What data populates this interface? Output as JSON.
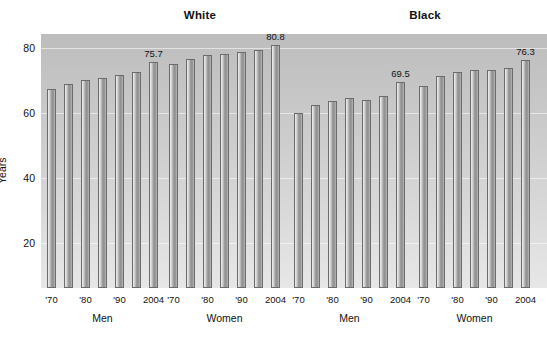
{
  "figure": {
    "clipped_top_text": "",
    "ylabel": "Years",
    "y_ticks": [
      20,
      40,
      60,
      80
    ],
    "group_headers": [
      {
        "label": "White"
      },
      {
        "label": "Black"
      }
    ],
    "sex_labels": [
      "Men",
      "Women",
      "Men",
      "Women"
    ],
    "x_tick_labels": [
      "'70",
      "'80",
      "'90",
      "2004"
    ]
  },
  "chart_data": {
    "type": "bar",
    "title": "",
    "xlabel": "",
    "ylabel": "Years",
    "ylim": [
      0,
      85
    ],
    "y_ticks": [
      20,
      40,
      60,
      80
    ],
    "grid": true,
    "legend": "none",
    "panel_groups": [
      {
        "race": "White",
        "sex": "Men",
        "categories": [
          "'70",
          "",
          "'80",
          "",
          "'90",
          "",
          "2004"
        ],
        "values": [
          67.4,
          69.0,
          70.2,
          70.7,
          71.6,
          72.7,
          75.7
        ],
        "labeled_points": [
          {
            "category": "2004",
            "value": 75.7,
            "text": "75.7"
          }
        ]
      },
      {
        "race": "White",
        "sex": "Women",
        "categories": [
          "'70",
          "",
          "'80",
          "",
          "'90",
          "",
          "2004"
        ],
        "values": [
          75.0,
          76.6,
          77.9,
          78.1,
          78.8,
          79.4,
          80.8
        ],
        "labeled_points": [
          {
            "category": "2004",
            "value": 80.8,
            "text": "80.8"
          }
        ]
      },
      {
        "race": "Black",
        "sex": "Men",
        "categories": [
          "'70",
          "",
          "'80",
          "",
          "'90",
          "",
          "2004"
        ],
        "values": [
          60.0,
          62.4,
          63.8,
          64.5,
          64.0,
          65.2,
          69.5
        ],
        "labeled_points": [
          {
            "category": "2004",
            "value": 69.5,
            "text": "69.5"
          }
        ]
      },
      {
        "race": "Black",
        "sex": "Women",
        "categories": [
          "'70",
          "",
          "'80",
          "",
          "'90",
          "",
          "2004"
        ],
        "values": [
          68.3,
          71.5,
          72.5,
          73.1,
          73.3,
          73.9,
          76.3
        ],
        "labeled_points": [
          {
            "category": "2004",
            "value": 76.3,
            "text": "76.3"
          }
        ]
      }
    ]
  }
}
